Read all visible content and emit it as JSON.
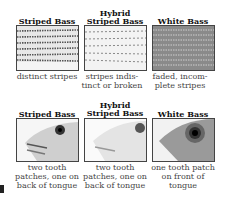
{
  "row1": {
    "columns": [
      {
        "title": "Striped Bass",
        "caption": "distinct stripes",
        "image": "striped-bass-scales"
      },
      {
        "title": "Hybrid Striped Bass",
        "caption": "stripes indis-tinct or broken",
        "image": "hybrid-bass-scales"
      },
      {
        "title": "White Bass",
        "caption": "faded, incom-plete stripes",
        "image": "white-bass-scales"
      }
    ]
  },
  "row2": {
    "columns": [
      {
        "title": "Striped Bass",
        "caption": "two tooth patches, one on back of tongue",
        "image": "striped-bass-head"
      },
      {
        "title": "Hybrid Striped Bass",
        "caption": "two tooth patches, one on back of tongue",
        "image": "hybrid-bass-head"
      },
      {
        "title": "White Bass",
        "caption": "one tooth patch on front of tongue",
        "image": "white-bass-head"
      }
    ]
  }
}
